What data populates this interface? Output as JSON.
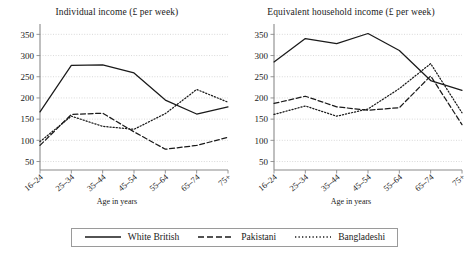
{
  "chart_data": [
    {
      "type": "line",
      "title": "Individual income (£ per week)",
      "xlabel": "Age in years",
      "ylabel": "",
      "categories": [
        "16–24",
        "25–34",
        "35–44",
        "45–54",
        "55–64",
        "65–74",
        "75+"
      ],
      "ylim": [
        30,
        365
      ],
      "yticks": [
        50,
        100,
        150,
        200,
        250,
        300,
        350
      ],
      "grid": true,
      "legend_position": "bottom",
      "series": [
        {
          "name": "White British",
          "style": "solid",
          "values": [
            167,
            277,
            278,
            259,
            195,
            162,
            179
          ]
        },
        {
          "name": "Pakistani",
          "style": "dashed",
          "values": [
            88,
            161,
            164,
            120,
            79,
            88,
            107
          ]
        },
        {
          "name": "Bangladeshi",
          "style": "dotted",
          "values": [
            97,
            157,
            133,
            126,
            163,
            220,
            190
          ]
        }
      ]
    },
    {
      "type": "line",
      "title": "Equivalent household income (£ per week)",
      "xlabel": "Age in years",
      "ylabel": "",
      "categories": [
        "16–24",
        "25–34",
        "35–44",
        "45–54",
        "55–64",
        "65–74",
        "75+"
      ],
      "ylim": [
        30,
        365
      ],
      "yticks": [
        50,
        100,
        150,
        200,
        250,
        300,
        350
      ],
      "grid": true,
      "legend_position": "bottom",
      "series": [
        {
          "name": "White British",
          "style": "solid",
          "values": [
            285,
            340,
            328,
            352,
            312,
            241,
            218
          ]
        },
        {
          "name": "Pakistani",
          "style": "dashed",
          "values": [
            187,
            204,
            179,
            171,
            177,
            252,
            137
          ]
        },
        {
          "name": "Bangladeshi",
          "style": "dotted",
          "values": [
            161,
            181,
            157,
            174,
            222,
            281,
            165
          ]
        }
      ]
    }
  ],
  "panels": [
    {
      "title": "Individual income (£ per week)",
      "xlabel": "Age in years"
    },
    {
      "title": "Equivalent household income (£ per week)",
      "xlabel": "Age in years"
    }
  ],
  "legend": {
    "items": [
      {
        "label": "White British",
        "style": "solid"
      },
      {
        "label": "Pakistani",
        "style": "dashed"
      },
      {
        "label": "Bangladeshi",
        "style": "dotted"
      }
    ]
  },
  "colors": {
    "line": "#1a1a1a",
    "grid": "#cfcfcf",
    "axis": "#8a8a8a",
    "legend_border": "#9a9a9a",
    "background": "#ffffff"
  }
}
